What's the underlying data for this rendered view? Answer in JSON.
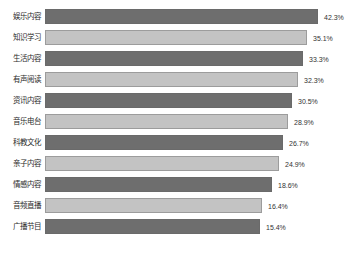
{
  "chart_data": {
    "type": "bar",
    "orientation": "horizontal",
    "title": "",
    "subtitle": "",
    "xlabel": "",
    "ylabel": "",
    "grid": false,
    "legend": false,
    "axis_visible": false,
    "value_suffix": "%",
    "categories": [
      "娱乐内容",
      "知识学习",
      "生活内容",
      "有声阅读",
      "资讯内容",
      "音乐电台",
      "科教文化",
      "亲子内容",
      "情感内容",
      "音频直播",
      "广播节目"
    ],
    "values": [
      42.3,
      35.1,
      33.3,
      32.3,
      30.5,
      28.9,
      26.7,
      24.9,
      18.6,
      16.4,
      15.4
    ],
    "value_labels": [
      "42.3%",
      "35.1%",
      "33.3%",
      "32.3%",
      "30.5%",
      "28.9%",
      "26.7%",
      "24.9%",
      "18.6%",
      "16.4%",
      "15.4%"
    ],
    "bar_pixel_widths": [
      273,
      262,
      258,
      253,
      247,
      243,
      238,
      234,
      227,
      217,
      215
    ],
    "bar_colors": [
      "#6e6e6e",
      "#c3c3c3",
      "#6e6e6e",
      "#c3c3c3",
      "#6e6e6e",
      "#c3c3c3",
      "#6e6e6e",
      "#c3c3c3",
      "#6e6e6e",
      "#c3c3c3",
      "#6e6e6e"
    ],
    "colors": {
      "dark_bar": "#6e6e6e",
      "light_bar": "#c3c3c3",
      "label_text": "#2b2b2b",
      "value_text": "#333333",
      "background": "#ffffff"
    }
  }
}
